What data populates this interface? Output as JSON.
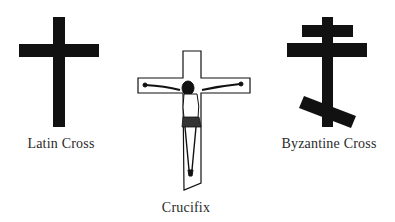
{
  "figures": [
    {
      "id": "latin",
      "label": "Latin Cross",
      "icon": "latin-cross-icon"
    },
    {
      "id": "crucifix",
      "label": "Crucifix",
      "icon": "crucifix-icon"
    },
    {
      "id": "byzantine",
      "label": "Byzantine Cross",
      "icon": "byzantine-cross-icon"
    }
  ],
  "colors": {
    "ink": "#111111",
    "background": "#ffffff",
    "label": "#2a2a2a"
  }
}
